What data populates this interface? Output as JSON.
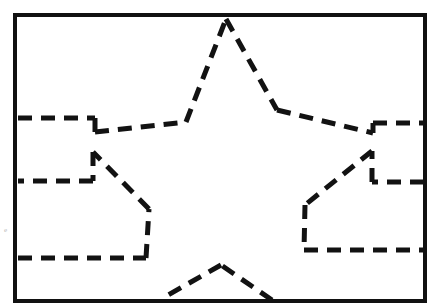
{
  "figure": {
    "background_color": "#ffffff",
    "canvas": {
      "width": 439,
      "height": 307
    },
    "frame": {
      "name": "outer-border-rectangle",
      "x": 15,
      "y": 15,
      "width": 410,
      "height": 286,
      "stroke_color": "#111111",
      "stroke_width": 4,
      "style": "solid"
    },
    "star_outline": {
      "name": "five-point-star-dashed-outline",
      "stroke_color": "#121212",
      "stroke_width": 5,
      "style": "dashed",
      "dash_pattern": "14 9",
      "description": "Five-pointed star traced with dashed segments; the upper point touches the top frame edge, the two lower points touch the bottom frame edge, and the two side arms run off to the left and right frame edges.",
      "segments": [
        {
          "name": "left-upper-arm-horizontal",
          "points": "18,118 95,118"
        },
        {
          "name": "left-upper-arm-step-down",
          "points": "95,118 95,132"
        },
        {
          "name": "left-upper-inner-slope",
          "points": "95,132 186,122"
        },
        {
          "name": "top-point-left-edge",
          "points": "186,122 226,19"
        },
        {
          "name": "top-point-right-edge",
          "points": "226,19 277,110"
        },
        {
          "name": "right-upper-inner-slope",
          "points": "277,110 373,133"
        },
        {
          "name": "right-upper-arm-step-up",
          "points": "373,133 373,123"
        },
        {
          "name": "right-upper-arm-horizontal",
          "points": "373,123 424,123"
        },
        {
          "name": "right-mid-arm-horizontal",
          "points": "424,182 372,182"
        },
        {
          "name": "right-mid-arm-step-up",
          "points": "372,182 372,151"
        },
        {
          "name": "right-lower-inner-slope",
          "points": "372,151 305,205"
        },
        {
          "name": "right-lower-arm-vertical",
          "points": "305,205 304,250"
        },
        {
          "name": "right-lower-arm-horizontal",
          "points": "304,250 424,250"
        },
        {
          "name": "bottom-right-point-edge",
          "points": "272,300 221,265"
        },
        {
          "name": "bottom-left-point-edge",
          "points": "221,265 161,299"
        },
        {
          "name": "left-lower-arm-horizontal",
          "points": "18,258 146,258"
        },
        {
          "name": "left-lower-arm-vertical",
          "points": "146,258 149,209"
        },
        {
          "name": "left-lower-inner-slope",
          "points": "149,209 93,152"
        },
        {
          "name": "left-mid-arm-step-down",
          "points": "93,152 93,181"
        },
        {
          "name": "left-mid-arm-horizontal",
          "points": "93,181 18,181"
        }
      ]
    },
    "margin_note": {
      "name": "faint-left-margin-mark",
      "text": "e",
      "x": 4,
      "y": 232,
      "color": "#b8b8b8"
    }
  }
}
